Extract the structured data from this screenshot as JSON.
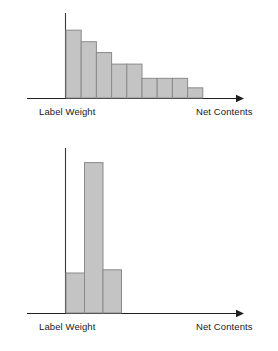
{
  "figure": {
    "background_color": "#ffffff",
    "bar_fill_color": "#c4c4c4",
    "bar_stroke_color": "#8a8a8a",
    "axis_color": "#1f1f1f"
  },
  "charts": [
    {
      "id": "top",
      "xlabel_left": "Label Weight",
      "xlabel_right": "Net Contents",
      "ylabel": "",
      "chart_data": {
        "type": "bar",
        "title": "",
        "subtitle": "",
        "xlabel": "Net Contents",
        "ylabel": "",
        "grid": false,
        "legend": false,
        "categories": [
          "1",
          "2",
          "3",
          "4",
          "5",
          "6",
          "7",
          "8",
          "9"
        ],
        "values": [
          100,
          83,
          67,
          50,
          50,
          29,
          29,
          29,
          15
        ],
        "xlim": [
          0,
          9
        ],
        "ylim": [
          0,
          115
        ],
        "annotations": [
          "Left edge of first bar sits at the Label Weight vertical axis",
          "Distribution is right-skewed, decreasing monotonically"
        ]
      }
    },
    {
      "id": "bottom",
      "xlabel_left": "Label Weight",
      "xlabel_right": "Net Contents",
      "ylabel": "",
      "chart_data": {
        "type": "bar",
        "title": "",
        "subtitle": "",
        "xlabel": "Net Contents",
        "ylabel": "",
        "grid": false,
        "legend": false,
        "categories": [
          "1",
          "2",
          "3"
        ],
        "values": [
          25,
          94,
          27
        ],
        "xlim": [
          0,
          3
        ],
        "ylim": [
          0,
          100
        ],
        "annotations": [
          "Left edge of first bar sits at the Label Weight vertical axis",
          "One dominant tall central bar flanked by two short bars"
        ]
      }
    }
  ]
}
